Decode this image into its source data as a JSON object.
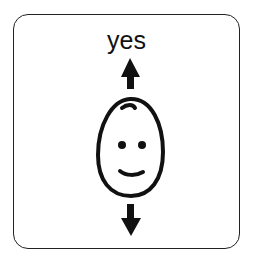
{
  "card": {
    "label": "yes",
    "symbol": "face-with-up-down-arrows-icon",
    "border_color": "#222222",
    "ink_color": "#111111"
  }
}
